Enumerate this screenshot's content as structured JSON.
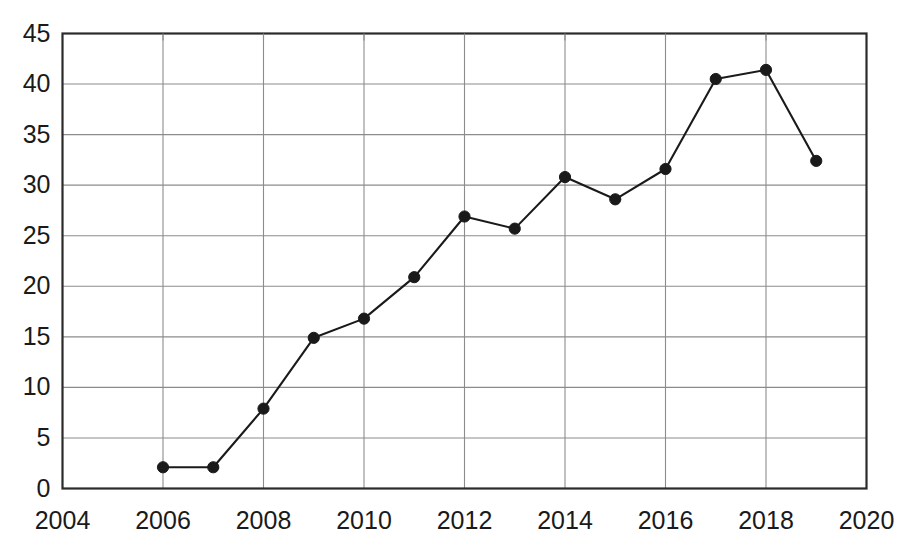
{
  "chart_data": {
    "type": "line",
    "title": "",
    "subtitle": "",
    "xlabel": "",
    "ylabel": "",
    "x": [
      2006,
      2007,
      2008,
      2009,
      2010,
      2011,
      2012,
      2013,
      2014,
      2015,
      2016,
      2017,
      2018,
      2019
    ],
    "values": [
      2.1,
      2.1,
      7.9,
      14.9,
      16.8,
      20.9,
      26.9,
      25.7,
      30.8,
      28.6,
      31.6,
      40.5,
      41.4,
      32.4
    ],
    "series": [
      {
        "name": "",
        "values": [
          2.1,
          2.1,
          7.9,
          14.9,
          16.8,
          20.9,
          26.9,
          25.7,
          30.8,
          28.6,
          31.6,
          40.5,
          41.4,
          32.4
        ]
      }
    ],
    "xlim": [
      2004,
      2020
    ],
    "ylim": [
      0,
      45
    ],
    "xticks": [
      2004,
      2006,
      2008,
      2010,
      2012,
      2014,
      2016,
      2018,
      2020
    ],
    "xtick_labels": [
      "2004",
      "2006",
      "2008",
      "2010",
      "2012",
      "2014",
      "2016",
      "2018",
      "2020"
    ],
    "yticks": [
      0,
      5,
      10,
      15,
      20,
      25,
      30,
      35,
      40,
      45
    ],
    "ytick_labels": [
      "0",
      "5",
      "10",
      "15",
      "20",
      "25",
      "30",
      "35",
      "40",
      "45"
    ],
    "grid": true,
    "grid_axes": "both",
    "legend": false,
    "legend_position": "none",
    "marker": "filled-circle",
    "line_color": "#1a1a1a",
    "marker_color": "#1a1a1a",
    "grid_color": "#8c8c8c",
    "axis_color": "#2b2b2b",
    "background_color": "#ffffff",
    "annotations": []
  },
  "axes": {
    "y_axis_name": "value-axis",
    "x_axis_name": "year-axis"
  }
}
